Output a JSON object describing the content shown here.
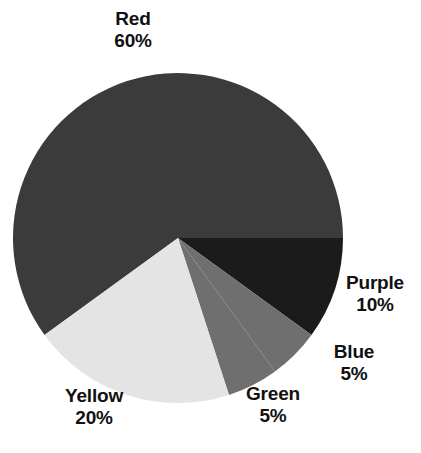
{
  "chart_data": {
    "type": "pie",
    "title": "",
    "labels": [
      "Red",
      "Purple",
      "Blue",
      "Green",
      "Yellow"
    ],
    "values": [
      60,
      10,
      5,
      5,
      20
    ],
    "value_labels": [
      "60%",
      "10%",
      "5%",
      "5%",
      "20%"
    ],
    "units": "percent",
    "total": 100,
    "legend": "none",
    "labels_position": "outside",
    "start_angle_deg": 0,
    "direction": "clockwise",
    "slice_colors": [
      "#3b3b3b",
      "#1b1b1b",
      "#6f6f6f",
      "#6f6f6f",
      "#e4e4e4"
    ],
    "background": "#ffffff",
    "text_color": "#111111",
    "slices": [
      {
        "name": "Red",
        "value": 60,
        "value_label": "60%",
        "color": "#3b3b3b",
        "start_deg": 144,
        "sweep_deg": 216
      },
      {
        "name": "Purple",
        "value": 10,
        "value_label": "10%",
        "color": "#1b1b1b",
        "start_deg": 0,
        "sweep_deg": 36
      },
      {
        "name": "Blue",
        "value": 5,
        "value_label": "5%",
        "color": "#6f6f6f",
        "start_deg": 36,
        "sweep_deg": 18
      },
      {
        "name": "Green",
        "value": 5,
        "value_label": "5%",
        "color": "#6f6f6f",
        "start_deg": 54,
        "sweep_deg": 18
      },
      {
        "name": "Yellow",
        "value": 20,
        "value_label": "20%",
        "color": "#e4e4e4",
        "start_deg": 72,
        "sweep_deg": 72
      }
    ],
    "geometry": {
      "center_x": 178,
      "center_y": 238,
      "radius": 165
    }
  },
  "labels": {
    "red": {
      "name": "Red",
      "value": "60%"
    },
    "purple": {
      "name": "Purple",
      "value": "10%"
    },
    "blue": {
      "name": "Blue",
      "value": "5%"
    },
    "green": {
      "name": "Green",
      "value": "5%"
    },
    "yellow": {
      "name": "Yellow",
      "value": "20%"
    }
  }
}
